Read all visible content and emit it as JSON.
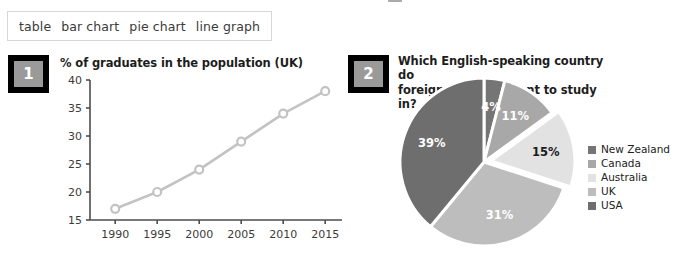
{
  "worksheet": {
    "word_bank": {
      "name": "word-bank",
      "options": [
        "table",
        "bar chart",
        "pie chart",
        "line graph"
      ]
    },
    "exercises": [
      {
        "number": "1",
        "title": "% of graduates in the population (UK)"
      },
      {
        "number": "2",
        "title": "Which English-speaking country do foreign students want to study in?",
        "title_line1": "Which English-speaking country do",
        "title_line2": "foreign students want to study in?"
      }
    ]
  },
  "chart_data": [
    {
      "type": "line",
      "title": "% of graduates in the population (UK)",
      "xlabel": "",
      "ylabel": "",
      "categories": [
        "1990",
        "1995",
        "2000",
        "2005",
        "2010",
        "2015"
      ],
      "x": [
        1990,
        1995,
        2000,
        2005,
        2010,
        2015
      ],
      "values": [
        17,
        20,
        24,
        29,
        34,
        38
      ],
      "yticks": [
        15,
        20,
        25,
        30,
        35,
        40
      ],
      "ylim": [
        15,
        40
      ],
      "xlim": [
        1987,
        2017
      ],
      "grid": false,
      "legend": "none",
      "marker": "open-circle",
      "line_color": "#c3c3c3",
      "marker_color": "#c3c3c3",
      "axis_color": "#4d4d4d"
    },
    {
      "type": "pie",
      "title": "Which English-speaking country do foreign students want to study in?",
      "labels": [
        "New Zealand",
        "Canada",
        "Australia",
        "UK",
        "USA"
      ],
      "values": [
        4,
        11,
        15,
        31,
        39
      ],
      "display_values": [
        "4%",
        "11%",
        "15%",
        "31%",
        "39%"
      ],
      "colors": [
        "#757575",
        "#a8a8a8",
        "#e2e2e2",
        "#bdbdbd",
        "#6e6e6e"
      ],
      "label_colors": [
        "#ffffff",
        "#ffffff",
        "#1a1a1a",
        "#ffffff",
        "#ffffff"
      ],
      "exploded": [
        "Australia"
      ],
      "start_angle_deg": 0,
      "direction": "clockwise",
      "legend": "right",
      "gap_color": "#ffffff"
    }
  ]
}
